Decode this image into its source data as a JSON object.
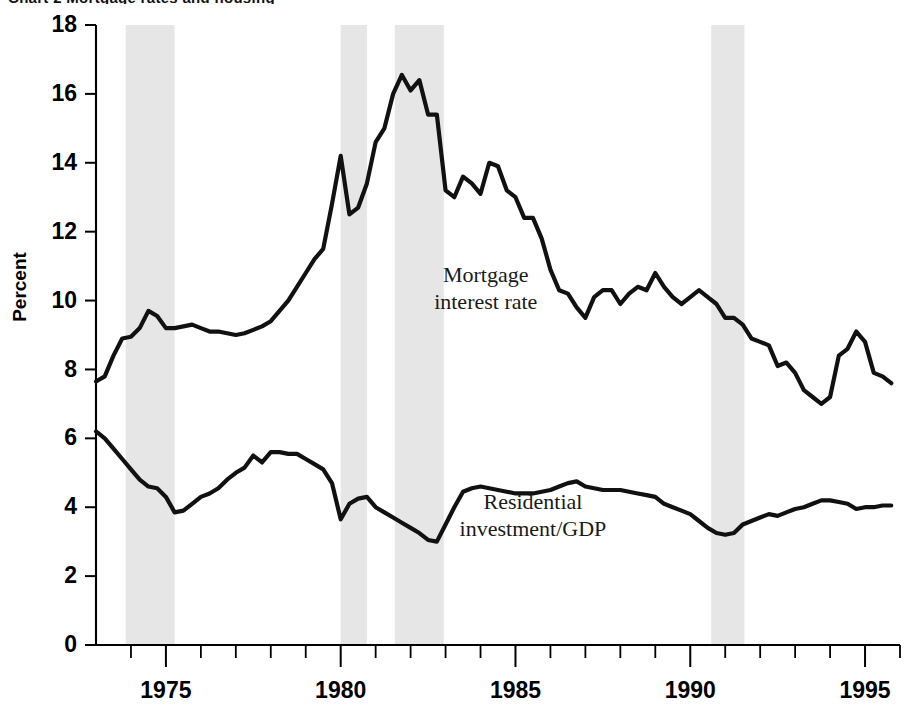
{
  "figure": {
    "cropped_header_text": "Chart 2  Mortgage rates and housing",
    "ylabel": "Percent",
    "annotations": [
      {
        "name": "mortgage-label",
        "lines": [
          "Mortgage",
          "interest rate"
        ],
        "x_year": 1984.15,
        "y_value": 10.55,
        "align": "start"
      },
      {
        "name": "residential-label",
        "lines": [
          "Residential",
          "investment/GDP"
        ],
        "x_year": 1985.5,
        "y_value": 3.95,
        "align": "middle"
      }
    ]
  },
  "chart_data": {
    "type": "line",
    "title": "",
    "xlabel": "",
    "ylabel": "Percent",
    "xlim": [
      1973.0,
      1996.0
    ],
    "ylim": [
      0,
      18
    ],
    "ytick_values": [
      0,
      2,
      4,
      6,
      8,
      10,
      12,
      14,
      16,
      18
    ],
    "ytick_labels": [
      "0",
      "2",
      "4",
      "6",
      "8",
      "10",
      "12",
      "14",
      "16",
      "18"
    ],
    "xtick_major_values": [
      1975,
      1980,
      1985,
      1990,
      1995
    ],
    "xtick_major_labels": [
      "1975",
      "1980",
      "1985",
      "1990",
      "1995"
    ],
    "xtick_minor_values": [
      1974,
      1976,
      1977,
      1978,
      1979,
      1981,
      1982,
      1983,
      1984,
      1986,
      1987,
      1988,
      1989,
      1991,
      1992,
      1993,
      1994,
      1996
    ],
    "grid": false,
    "legend_position": "inline-annotations",
    "shaded_bands": {
      "name": "recession-bands",
      "color": "#e6e6e6",
      "label": "recession",
      "ranges": [
        [
          1973.85,
          1975.25
        ],
        [
          1980.0,
          1980.75
        ],
        [
          1981.55,
          1982.95
        ],
        [
          1990.6,
          1991.55
        ]
      ]
    },
    "series": [
      {
        "name": "Mortgage interest rate",
        "color": "#111111",
        "unit": "percent",
        "x": [
          1973.0,
          1973.25,
          1973.5,
          1973.75,
          1974.0,
          1974.25,
          1974.5,
          1974.75,
          1975.0,
          1975.25,
          1975.5,
          1975.75,
          1976.0,
          1976.25,
          1976.5,
          1976.75,
          1977.0,
          1977.25,
          1977.5,
          1977.75,
          1978.0,
          1978.25,
          1978.5,
          1978.75,
          1979.0,
          1979.25,
          1979.5,
          1979.75,
          1980.0,
          1980.25,
          1980.5,
          1980.75,
          1981.0,
          1981.25,
          1981.5,
          1981.75,
          1982.0,
          1982.25,
          1982.5,
          1982.75,
          1983.0,
          1983.25,
          1983.5,
          1983.75,
          1984.0,
          1984.25,
          1984.5,
          1984.75,
          1985.0,
          1985.25,
          1985.5,
          1985.75,
          1986.0,
          1986.25,
          1986.5,
          1986.75,
          1987.0,
          1987.25,
          1987.5,
          1987.75,
          1988.0,
          1988.25,
          1988.5,
          1988.75,
          1989.0,
          1989.25,
          1989.5,
          1989.75,
          1990.0,
          1990.25,
          1990.5,
          1990.75,
          1991.0,
          1991.25,
          1991.5,
          1991.75,
          1992.0,
          1992.25,
          1992.5,
          1992.75,
          1993.0,
          1993.25,
          1993.5,
          1993.75,
          1994.0,
          1994.25,
          1994.5,
          1994.75,
          1995.0,
          1995.25,
          1995.5,
          1995.75
        ],
        "y": [
          7.65,
          7.8,
          8.4,
          8.9,
          8.95,
          9.2,
          9.7,
          9.55,
          9.2,
          9.2,
          9.25,
          9.3,
          9.2,
          9.1,
          9.1,
          9.05,
          9.0,
          9.05,
          9.15,
          9.25,
          9.4,
          9.7,
          10.0,
          10.4,
          10.8,
          11.2,
          11.5,
          12.8,
          14.2,
          12.5,
          12.7,
          13.4,
          14.6,
          15.0,
          16.0,
          16.55,
          16.1,
          16.4,
          15.4,
          15.4,
          13.2,
          13.0,
          13.6,
          13.4,
          13.1,
          14.0,
          13.9,
          13.2,
          13.0,
          12.4,
          12.4,
          11.8,
          10.9,
          10.3,
          10.2,
          9.8,
          9.5,
          10.1,
          10.3,
          10.3,
          9.9,
          10.2,
          10.4,
          10.3,
          10.8,
          10.4,
          10.1,
          9.9,
          10.1,
          10.3,
          10.1,
          9.9,
          9.5,
          9.5,
          9.3,
          8.9,
          8.8,
          8.7,
          8.1,
          8.2,
          7.9,
          7.4,
          7.2,
          7.0,
          7.2,
          8.4,
          8.6,
          9.1,
          8.8,
          7.9,
          7.8,
          7.6
        ]
      },
      {
        "name": "Residential investment/GDP",
        "color": "#111111",
        "unit": "percent of GDP",
        "x": [
          1973.0,
          1973.25,
          1973.5,
          1973.75,
          1974.0,
          1974.25,
          1974.5,
          1974.75,
          1975.0,
          1975.25,
          1975.5,
          1975.75,
          1976.0,
          1976.25,
          1976.5,
          1976.75,
          1977.0,
          1977.25,
          1977.5,
          1977.75,
          1978.0,
          1978.25,
          1978.5,
          1978.75,
          1979.0,
          1979.25,
          1979.5,
          1979.75,
          1980.0,
          1980.25,
          1980.5,
          1980.75,
          1981.0,
          1981.25,
          1981.5,
          1981.75,
          1982.0,
          1982.25,
          1982.5,
          1982.75,
          1983.0,
          1983.25,
          1983.5,
          1983.75,
          1984.0,
          1984.25,
          1984.5,
          1984.75,
          1985.0,
          1985.25,
          1985.5,
          1985.75,
          1986.0,
          1986.25,
          1986.5,
          1986.75,
          1987.0,
          1987.25,
          1987.5,
          1987.75,
          1988.0,
          1988.25,
          1988.5,
          1988.75,
          1989.0,
          1989.25,
          1989.5,
          1989.75,
          1990.0,
          1990.25,
          1990.5,
          1990.75,
          1991.0,
          1991.25,
          1991.5,
          1991.75,
          1992.0,
          1992.25,
          1992.5,
          1992.75,
          1993.0,
          1993.25,
          1993.5,
          1993.75,
          1994.0,
          1994.25,
          1994.5,
          1994.75,
          1995.0,
          1995.25,
          1995.5,
          1995.75
        ],
        "y": [
          6.2,
          6.0,
          5.7,
          5.4,
          5.1,
          4.8,
          4.6,
          4.55,
          4.3,
          3.85,
          3.9,
          4.1,
          4.3,
          4.4,
          4.55,
          4.8,
          5.0,
          5.15,
          5.5,
          5.3,
          5.6,
          5.6,
          5.55,
          5.55,
          5.4,
          5.25,
          5.1,
          4.7,
          3.65,
          4.1,
          4.25,
          4.3,
          4.0,
          3.85,
          3.7,
          3.55,
          3.4,
          3.25,
          3.05,
          3.0,
          3.5,
          4.0,
          4.45,
          4.55,
          4.6,
          4.55,
          4.5,
          4.45,
          4.4,
          4.4,
          4.4,
          4.45,
          4.5,
          4.6,
          4.7,
          4.75,
          4.6,
          4.55,
          4.5,
          4.5,
          4.5,
          4.45,
          4.4,
          4.35,
          4.3,
          4.1,
          4.0,
          3.9,
          3.8,
          3.6,
          3.4,
          3.25,
          3.2,
          3.25,
          3.5,
          3.6,
          3.7,
          3.8,
          3.75,
          3.85,
          3.95,
          4.0,
          4.1,
          4.2,
          4.2,
          4.15,
          4.1,
          3.95,
          4.0,
          4.0,
          4.05,
          4.05
        ]
      }
    ]
  }
}
